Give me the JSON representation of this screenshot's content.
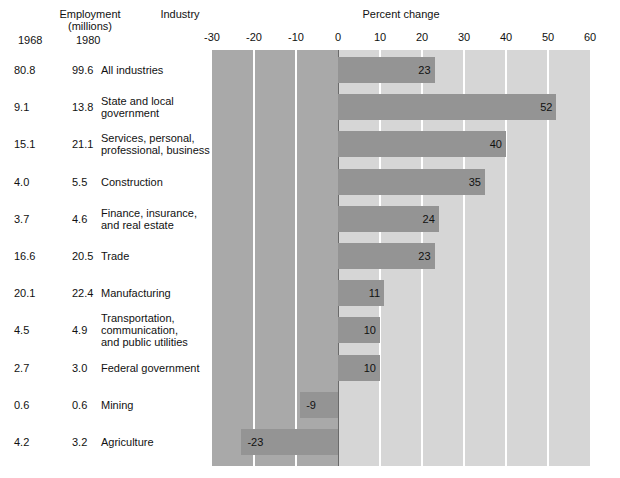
{
  "header": {
    "employment_title_line1": "Employment",
    "employment_title_line2": "(millions)",
    "industry_title": "Industry",
    "year_col_1": "1968",
    "year_col_2": "1980",
    "chart_title": "Percent change"
  },
  "axis": {
    "ticks": [
      "-30",
      "-20",
      "-10",
      "0",
      "10",
      "20",
      "30",
      "40",
      "50",
      "60"
    ],
    "min": -30,
    "max": 60,
    "step": 10
  },
  "colors": {
    "negative_band": "#a9a9a9",
    "positive_band": "#d6d6d6",
    "bar": "#949494",
    "gridline": "#ffffff",
    "zeroline": "#6a6a6a",
    "text": "#111111",
    "page": "#ffffff"
  },
  "chart_data": {
    "type": "bar",
    "orientation": "horizontal",
    "title": "Percent change",
    "xlabel": "Percent change",
    "ylabel": "Industry",
    "xlim": [
      -30,
      60
    ],
    "xticks": [
      -30,
      -20,
      -10,
      0,
      10,
      20,
      30,
      40,
      50,
      60
    ],
    "grid": true,
    "legend": "none",
    "categories": [
      "All industries",
      "State and local government",
      "Services, personal, professional, business",
      "Construction",
      "Finance, insurance, and real estate",
      "Trade",
      "Manufacturing",
      "Transportation, communication, and public utilities",
      "Federal government",
      "Mining",
      "Agriculture"
    ],
    "values": [
      23,
      52,
      40,
      35,
      24,
      23,
      11,
      10,
      10,
      -9,
      -23
    ],
    "employment_1968": [
      80.8,
      9.1,
      15.1,
      4.0,
      3.7,
      16.6,
      20.1,
      4.5,
      2.7,
      0.6,
      4.2
    ],
    "employment_1980": [
      99.6,
      13.8,
      21.1,
      5.5,
      4.6,
      20.5,
      22.4,
      4.9,
      3.0,
      0.6,
      3.2
    ]
  },
  "rows": [
    {
      "v1": "80.8",
      "v2": "99.6",
      "value": 23,
      "label": "23",
      "name_lines": [
        "All industries"
      ]
    },
    {
      "v1": "9.1",
      "v2": "13.8",
      "value": 52,
      "label": "52",
      "name_lines": [
        "State and local",
        "government"
      ]
    },
    {
      "v1": "15.1",
      "v2": "21.1",
      "value": 40,
      "label": "40",
      "name_lines": [
        "Services, personal,",
        "professional, business"
      ]
    },
    {
      "v1": "4.0",
      "v2": "5.5",
      "value": 35,
      "label": "35",
      "name_lines": [
        "Construction"
      ]
    },
    {
      "v1": "3.7",
      "v2": "4.6",
      "value": 24,
      "label": "24",
      "name_lines": [
        "Finance, insurance,",
        "and real estate"
      ]
    },
    {
      "v1": "16.6",
      "v2": "20.5",
      "value": 23,
      "label": "23",
      "name_lines": [
        "Trade"
      ]
    },
    {
      "v1": "20.1",
      "v2": "22.4",
      "value": 11,
      "label": "11",
      "name_lines": [
        "Manufacturing"
      ]
    },
    {
      "v1": "4.5",
      "v2": "4.9",
      "value": 10,
      "label": "10",
      "name_lines": [
        "Transportation,",
        "communication,",
        "and public utilities"
      ]
    },
    {
      "v1": "2.7",
      "v2": "3.0",
      "value": 10,
      "label": "10",
      "name_lines": [
        "Federal government"
      ]
    },
    {
      "v1": "0.6",
      "v2": "0.6",
      "value": -9,
      "label": "-9",
      "name_lines": [
        "Mining"
      ]
    },
    {
      "v1": "4.2",
      "v2": "3.2",
      "value": -23,
      "label": "-23",
      "name_lines": [
        "Agriculture"
      ]
    }
  ]
}
